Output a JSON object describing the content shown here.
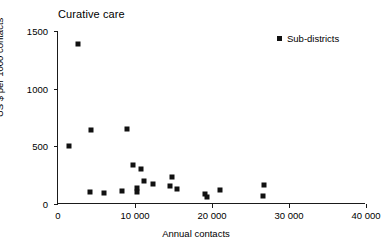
{
  "chart_data": {
    "type": "scatter",
    "title": "Curative care",
    "xlabel": "Annual contacts",
    "ylabel": "US $ per 1000 contacts",
    "xlim": [
      0,
      40000
    ],
    "ylim": [
      0,
      1500
    ],
    "xticks": [
      0,
      10000,
      20000,
      30000,
      40000
    ],
    "xtick_labels": [
      "0",
      "10 000",
      "20 000",
      "30 000",
      "40 000"
    ],
    "yticks": [
      0,
      500,
      1000,
      1500
    ],
    "ytick_labels": [
      "0",
      "500",
      "1000",
      "1500"
    ],
    "grid": false,
    "legend_position": "top-right",
    "marker": "square",
    "marker_color": "#111111",
    "series": [
      {
        "name": "Sub-districts",
        "points": [
          [
            2600,
            1390
          ],
          [
            1400,
            500
          ],
          [
            4300,
            640
          ],
          [
            9000,
            650
          ],
          [
            4200,
            100
          ],
          [
            6000,
            95
          ],
          [
            9700,
            340
          ],
          [
            10800,
            300
          ],
          [
            11200,
            200
          ],
          [
            10300,
            140
          ],
          [
            12400,
            170
          ],
          [
            14500,
            155
          ],
          [
            14800,
            235
          ],
          [
            15500,
            130
          ],
          [
            8300,
            110
          ],
          [
            10200,
            100
          ],
          [
            19100,
            85
          ],
          [
            19300,
            60
          ],
          [
            21000,
            120
          ],
          [
            26700,
            165
          ],
          [
            26600,
            70
          ]
        ]
      }
    ]
  },
  "legend": {
    "entries": [
      {
        "label": "Sub-districts",
        "color": "#111111"
      }
    ]
  }
}
